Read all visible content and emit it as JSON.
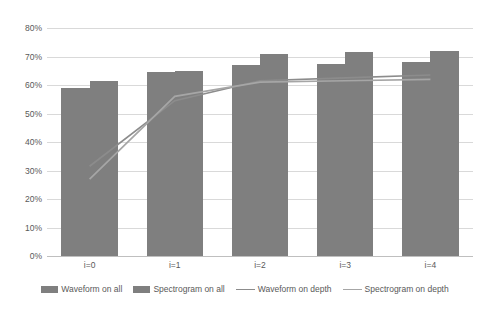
{
  "chart_data": {
    "type": "bar",
    "title": "",
    "xlabel": "",
    "ylabel": "",
    "categories": [
      "i=0",
      "i=1",
      "i=2",
      "i=3",
      "i=4"
    ],
    "ylim": [
      0,
      80
    ],
    "ytick_labels": [
      "80%",
      "70%",
      "60%",
      "50%",
      "40%",
      "30%",
      "20%",
      "10%",
      "0%"
    ],
    "ytick_values": [
      80,
      70,
      60,
      50,
      40,
      30,
      20,
      10,
      0
    ],
    "grid": true,
    "legend_position": "bottom",
    "series": [
      {
        "name": "Waveform on all",
        "kind": "bar",
        "color": "#7f7f7f",
        "values": [
          59,
          64.5,
          67,
          67.5,
          68
        ]
      },
      {
        "name": "Spectrogram on all",
        "kind": "bar",
        "color": "#7f7f7f",
        "values": [
          61.5,
          65,
          71,
          71.5,
          72
        ]
      },
      {
        "name": "Waveform on depth",
        "kind": "line",
        "color": "#8c8c8c",
        "values": [
          31.5,
          54.5,
          61.5,
          62.5,
          63.5
        ]
      },
      {
        "name": "Spectrogram on depth",
        "kind": "line",
        "color": "#a6a6a6",
        "values": [
          27,
          56,
          61,
          61.5,
          62
        ]
      }
    ]
  },
  "legend": {
    "items": [
      {
        "label": "Waveform on all",
        "marker": "bar-swatch-icon"
      },
      {
        "label": "Spectrogram on all",
        "marker": "bar-swatch-icon"
      },
      {
        "label": "Waveform on depth",
        "marker": "line-swatch-icon"
      },
      {
        "label": "Spectrogram on depth",
        "marker": "line-swatch-icon"
      }
    ]
  }
}
